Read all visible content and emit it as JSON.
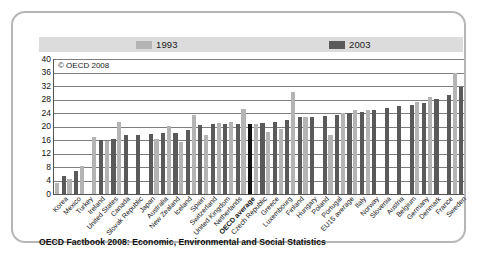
{
  "figure": {
    "copyright": "© OECD 2008",
    "caption": "OECD Factbook 2008: Economic, Environmental and Social Statistics"
  },
  "legend": {
    "items": [
      {
        "label": "1993",
        "color": "#b4b4b4",
        "swatch_name": "legend-swatch-1993"
      },
      {
        "label": "2003",
        "color": "#5a5a5a",
        "swatch_name": "legend-swatch-2003"
      }
    ]
  },
  "colors": {
    "series_1993": "#b4b4b4",
    "series_2003": "#5a5a5a",
    "highlight": "#111111",
    "gridline": "#7d7d7d",
    "axis": "#555555",
    "frame": "#b6b6b6",
    "legend_band": "#dcdcdc"
  },
  "chart_data": {
    "type": "bar",
    "title": "",
    "subtitle": "",
    "xlabel": "",
    "ylabel": "",
    "ylim": [
      0,
      40
    ],
    "yticks": [
      0,
      4,
      8,
      12,
      16,
      20,
      24,
      28,
      32,
      36,
      40
    ],
    "grid": true,
    "legend_position": "top",
    "categories": [
      "Korea",
      "Mexico",
      "Turkey",
      "Ireland",
      "United States",
      "Canada",
      "Slovak Republic",
      "Japan",
      "Australia",
      "New Zealand",
      "Iceland",
      "Spain",
      "Switzerland",
      "United Kingdom",
      "Netherlands",
      "OECD average",
      "Czech Republic",
      "Greece",
      "Luxembourg",
      "Finland",
      "Hungary",
      "Poland",
      "Portugal",
      "EU15 average",
      "Italy",
      "Norway",
      "Slovenia",
      "Austria",
      "Belgium",
      "Germany",
      "Denmark",
      "France",
      "Sweden"
    ],
    "highlight_category": "OECD average",
    "series": [
      {
        "name": "1993",
        "color": "#b4b4b4",
        "values": [
          3.2,
          4.4,
          8.2,
          17.0,
          15.8,
          21.2,
          null,
          null,
          16.4,
          20.3,
          15.4,
          23.4,
          17.6,
          21.0,
          21.2,
          25.2,
          20.8,
          18.4,
          19.4,
          30.2,
          22.8,
          null,
          17.6,
          24.0,
          24.9,
          24.9,
          null,
          null,
          null,
          27.4,
          28.6,
          null,
          36.0
        ]
      },
      {
        "name": "2003",
        "color": "#5a5a5a",
        "values": [
          5.4,
          6.8,
          null,
          16.0,
          16.2,
          17.4,
          17.6,
          17.9,
          18.1,
          18.1,
          19.0,
          20.4,
          20.6,
          20.8,
          20.6,
          20.8,
          20.9,
          21.4,
          21.8,
          22.8,
          22.8,
          23.1,
          23.4,
          24.0,
          24.4,
          24.8,
          25.6,
          26.0,
          26.5,
          27.1,
          28.2,
          29.2,
          31.8
        ]
      }
    ]
  }
}
